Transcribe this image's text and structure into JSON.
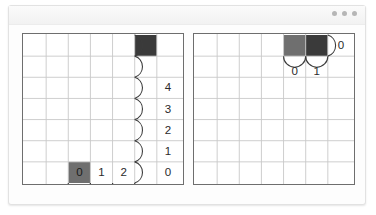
{
  "window": {
    "title": "",
    "controls": [
      {
        "name": "window-dot-1"
      },
      {
        "name": "window-dot-2"
      },
      {
        "name": "window-dot-3"
      }
    ]
  },
  "colors": {
    "dark_cell": "#3a3a3a",
    "gray_cell": "#6f6f6f",
    "gridline": "#c9c9c9",
    "panel_border": "#6e6e6e",
    "label_text": "#2b2b2b",
    "background": "#ffffff"
  },
  "panels": [
    {
      "id": "left",
      "grid": {
        "cols": 7,
        "rows": 7,
        "cell": 22
      },
      "cells": [
        {
          "name": "dark-cell",
          "col": 5,
          "row": 1,
          "fill": "dark",
          "label": ""
        },
        {
          "name": "gray-cell",
          "col": 2,
          "row": 6,
          "fill": "gray",
          "label": "0"
        }
      ],
      "bottom_arc_labels": [
        "0",
        "1",
        "2"
      ],
      "right_arc_labels": [
        "0",
        "1",
        "2",
        "3",
        "4"
      ]
    },
    {
      "id": "right",
      "grid": {
        "cols": 7,
        "rows": 7,
        "cell": 22
      },
      "cells": [
        {
          "name": "gray-cell",
          "col": 4,
          "row": 1,
          "fill": "gray",
          "label": ""
        },
        {
          "name": "dark-cell",
          "col": 5,
          "row": 1,
          "fill": "dark",
          "label": ""
        }
      ],
      "bottom_arc_labels": [
        "0",
        "1"
      ],
      "right_arc_labels": [
        "0"
      ]
    }
  ],
  "labels": {
    "left_bottom_0": "0",
    "left_bottom_1": "1",
    "left_bottom_2": "2",
    "left_cell_0": "0",
    "left_right_0": "0",
    "left_right_1": "1",
    "left_right_2": "2",
    "left_right_3": "3",
    "left_right_4": "4",
    "right_bottom_0": "0",
    "right_bottom_1": "1",
    "right_right_0": "0"
  }
}
